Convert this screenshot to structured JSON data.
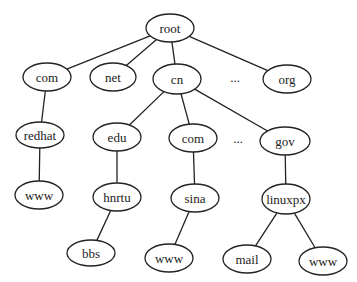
{
  "diagram": {
    "nodes": [
      {
        "id": "root",
        "label": "root",
        "cx": 170,
        "cy": 28,
        "rx": 24,
        "ry": 14
      },
      {
        "id": "com",
        "label": "com",
        "cx": 47,
        "cy": 77,
        "rx": 24,
        "ry": 14
      },
      {
        "id": "net",
        "label": "net",
        "cx": 113,
        "cy": 77,
        "rx": 23,
        "ry": 14
      },
      {
        "id": "cn",
        "label": "cn",
        "cx": 177,
        "cy": 79,
        "rx": 24,
        "ry": 15
      },
      {
        "id": "org",
        "label": "org",
        "cx": 287,
        "cy": 79,
        "rx": 24,
        "ry": 14
      },
      {
        "id": "redhat",
        "label": "redhat",
        "cx": 40,
        "cy": 135,
        "rx": 24,
        "ry": 13
      },
      {
        "id": "edu",
        "label": "edu",
        "cx": 117,
        "cy": 137,
        "rx": 24,
        "ry": 14
      },
      {
        "id": "com2",
        "label": "com",
        "cx": 193,
        "cy": 138,
        "rx": 24,
        "ry": 14
      },
      {
        "id": "gov",
        "label": "gov",
        "cx": 285,
        "cy": 141,
        "rx": 25,
        "ry": 14
      },
      {
        "id": "www1",
        "label": "www",
        "cx": 39,
        "cy": 195,
        "rx": 24,
        "ry": 14
      },
      {
        "id": "hnrtu",
        "label": "hnrtu",
        "cx": 117,
        "cy": 197,
        "rx": 24,
        "ry": 14
      },
      {
        "id": "sina",
        "label": "sina",
        "cx": 195,
        "cy": 198,
        "rx": 24,
        "ry": 14
      },
      {
        "id": "linuxpx",
        "label": "linuxpx",
        "cx": 286,
        "cy": 199,
        "rx": 24,
        "ry": 15
      },
      {
        "id": "bbs",
        "label": "bbs",
        "cx": 91,
        "cy": 253,
        "rx": 24,
        "ry": 13
      },
      {
        "id": "www2",
        "label": "www",
        "cx": 169,
        "cy": 258,
        "rx": 24,
        "ry": 14
      },
      {
        "id": "mail",
        "label": "mail",
        "cx": 247,
        "cy": 259,
        "rx": 24,
        "ry": 14
      },
      {
        "id": "www3",
        "label": "www",
        "cx": 323,
        "cy": 261,
        "rx": 24,
        "ry": 14
      }
    ],
    "edges": [
      [
        "root",
        "com"
      ],
      [
        "root",
        "net"
      ],
      [
        "root",
        "cn"
      ],
      [
        "root",
        "org"
      ],
      [
        "com",
        "redhat"
      ],
      [
        "redhat",
        "www1"
      ],
      [
        "cn",
        "edu"
      ],
      [
        "cn",
        "com2"
      ],
      [
        "cn",
        "gov"
      ],
      [
        "edu",
        "hnrtu"
      ],
      [
        "hnrtu",
        "bbs"
      ],
      [
        "com2",
        "sina"
      ],
      [
        "sina",
        "www2"
      ],
      [
        "gov",
        "linuxpx"
      ],
      [
        "linuxpx",
        "mail"
      ],
      [
        "linuxpx",
        "www3"
      ]
    ],
    "ellipses": [
      {
        "text": "...",
        "x": 235,
        "y": 82
      },
      {
        "text": "...",
        "x": 238,
        "y": 143
      }
    ]
  },
  "colors": {
    "stroke": "#222222",
    "background": "#ffffff"
  }
}
